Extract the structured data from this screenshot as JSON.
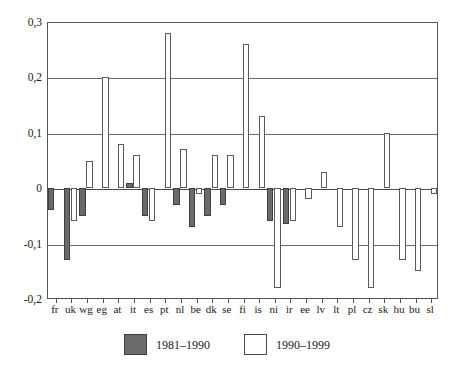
{
  "chart_data": {
    "type": "bar",
    "title": "",
    "subtitle": "",
    "xlabel": "",
    "ylabel": "",
    "ylim": [
      -0.2,
      0.3
    ],
    "ytick_labels": [
      "0,3",
      "0,2",
      "0,1",
      "0",
      "-0,1",
      "-0,2"
    ],
    "ytick_values": [
      0.3,
      0.2,
      0.1,
      0.0,
      -0.1,
      -0.2
    ],
    "grid": true,
    "decimal_separator": ",",
    "legend_position": "bottom",
    "categories": [
      "fr",
      "uk",
      "wg",
      "eg",
      "at",
      "it",
      "es",
      "pt",
      "nl",
      "be",
      "dk",
      "se",
      "fi",
      "is",
      "ni",
      "ir",
      "ee",
      "lv",
      "lt",
      "pl",
      "cz",
      "sk",
      "hu",
      "bu",
      "sl"
    ],
    "series": [
      {
        "name": "1981–1990",
        "fill": "#6a6a6a",
        "values": [
          -0.04,
          -0.13,
          -0.05,
          null,
          null,
          0.01,
          -0.05,
          null,
          -0.03,
          -0.07,
          -0.05,
          -0.03,
          null,
          null,
          -0.06,
          -0.065,
          null,
          null,
          null,
          null,
          null,
          null,
          null,
          null,
          null
        ]
      },
      {
        "name": "1990–1999",
        "fill": "#ffffff",
        "values": [
          null,
          -0.06,
          0.05,
          0.2,
          0.08,
          0.06,
          -0.06,
          0.28,
          0.07,
          -0.01,
          0.06,
          0.06,
          0.26,
          0.13,
          -0.18,
          -0.06,
          -0.02,
          0.03,
          -0.07,
          -0.13,
          -0.18,
          0.1,
          -0.13,
          -0.15,
          -0.01
        ]
      }
    ]
  },
  "legend": {
    "items": [
      {
        "label": "1981–1990",
        "style": "dark"
      },
      {
        "label": "1990–1999",
        "style": "light"
      }
    ]
  },
  "colors": {
    "series_1981_1990": "#6a6a6a",
    "series_1990_1999": "#ffffff",
    "axis": "#555555",
    "grid": "#6b6b6b",
    "background": "#ffffff"
  }
}
